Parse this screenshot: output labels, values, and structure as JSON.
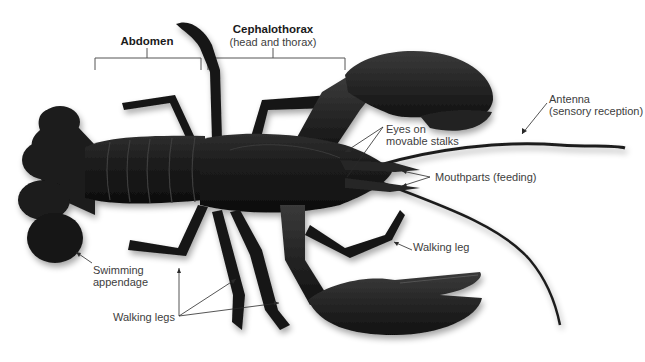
{
  "diagram": {
    "colors": {
      "body": "#1a1a1a",
      "body_highlight": "#3a3a3a",
      "label_text": "#3d3d3d",
      "leader_line": "#2a2a2a",
      "background": "#ffffff"
    },
    "regions": [
      {
        "id": "abdomen",
        "label": "Abdomen"
      },
      {
        "id": "cephalothorax",
        "label": "Cephalothorax",
        "sublabel": "(head and thorax)"
      }
    ],
    "labels": {
      "antenna": {
        "line1": "Antenna",
        "line2": "(sensory reception)"
      },
      "eyes": {
        "line1": "Eyes on",
        "line2": "movable stalks"
      },
      "mouthparts": {
        "text": "Mouthparts (feeding)"
      },
      "walking_leg": {
        "text": "Walking leg"
      },
      "swimming": {
        "line1": "Swimming",
        "line2": "appendage"
      },
      "walking_legs": {
        "text": "Walking legs"
      }
    }
  }
}
